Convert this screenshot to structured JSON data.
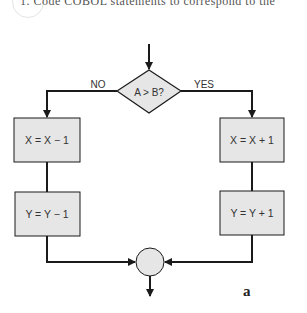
{
  "header": {
    "text": "1.  Code COBOL statements to correspond to the"
  },
  "decision": {
    "label": "A > B?",
    "no_label": "NO",
    "yes_label": "YES"
  },
  "left_branch": {
    "boxes": [
      {
        "label": "X = X − 1"
      },
      {
        "label": "Y = Y − 1"
      }
    ]
  },
  "right_branch": {
    "boxes": [
      {
        "label": "X = X + 1"
      },
      {
        "label": "Y = Y + 1"
      }
    ]
  },
  "connector": {
    "label": ""
  },
  "figure_label": "a",
  "colors": {
    "box_fill": "#e6e6e6",
    "stroke": "#1a1a1a"
  }
}
